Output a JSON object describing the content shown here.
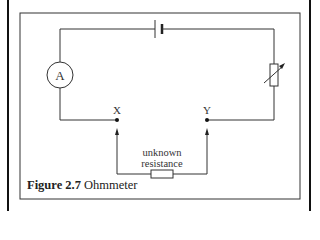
{
  "figure": {
    "number_label": "Figure 2.7",
    "title": "Ohmmeter"
  },
  "components": {
    "ammeter_label": "A",
    "terminal_x_label": "X",
    "terminal_y_label": "Y",
    "unknown_resistance_label_line1": "unknown",
    "unknown_resistance_label_line2": "resistance"
  }
}
